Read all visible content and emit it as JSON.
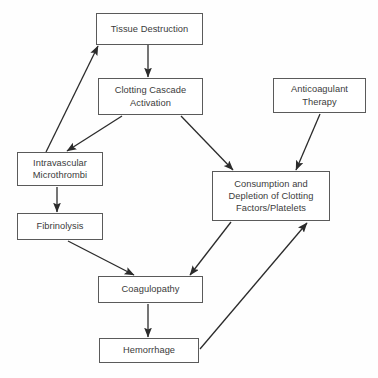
{
  "diagram": {
    "type": "flowchart",
    "canvas": {
      "width": 378,
      "height": 378,
      "background": "#fefefe"
    },
    "style": {
      "box_border": "#5a5a5a",
      "box_fill": "#ffffff",
      "text_color": "#3b3b3b",
      "edge_color": "#2b2b2b"
    },
    "nodes": [
      {
        "id": "tissue-destruction",
        "label": "Tissue Destruction",
        "x": 96,
        "y": 13,
        "w": 107,
        "h": 32
      },
      {
        "id": "clotting-cascade-activation",
        "label": "Clotting Cascade\nActivation",
        "x": 98,
        "y": 78,
        "w": 105,
        "h": 37
      },
      {
        "id": "anticoagulant-therapy",
        "label": "Anticoagulant\nTherapy",
        "x": 273,
        "y": 78,
        "w": 93,
        "h": 35
      },
      {
        "id": "intravascular-microthrombi",
        "label": "Intravascular\nMicrothrombi",
        "x": 17,
        "y": 152,
        "w": 86,
        "h": 34
      },
      {
        "id": "consumption-depletion",
        "label": "Consumption and\nDepletion of Clotting\nFactors/Platelets",
        "x": 212,
        "y": 171,
        "w": 118,
        "h": 50
      },
      {
        "id": "fibrinolysis",
        "label": "Fibrinolysis",
        "x": 17,
        "y": 213,
        "w": 86,
        "h": 27
      },
      {
        "id": "coagulopathy",
        "label": "Coagulopathy",
        "x": 98,
        "y": 276,
        "w": 105,
        "h": 27
      },
      {
        "id": "hemorrhage",
        "label": "Hemorrhage",
        "x": 99,
        "y": 338,
        "w": 100,
        "h": 25
      }
    ],
    "edges": [
      {
        "id": "edge-tissue-to-clotting",
        "from": "tissue-destruction",
        "to": "clotting-cascade-activation",
        "x1": 148,
        "y1": 45,
        "x2": 148,
        "y2": 77
      },
      {
        "id": "edge-clotting-to-microthrombi",
        "from": "clotting-cascade-activation",
        "to": "intravascular-microthrombi",
        "x1": 122,
        "y1": 116,
        "x2": 67,
        "y2": 151
      },
      {
        "id": "edge-clotting-to-consumption",
        "from": "clotting-cascade-activation",
        "to": "consumption-depletion",
        "x1": 181,
        "y1": 116,
        "x2": 233,
        "y2": 170
      },
      {
        "id": "edge-microthrombi-to-tissue",
        "from": "intravascular-microthrombi",
        "to": "tissue-destruction",
        "x1": 46,
        "y1": 152,
        "x2": 98,
        "y2": 46
      },
      {
        "id": "edge-anticoagulant-to-consumption",
        "from": "anticoagulant-therapy",
        "to": "consumption-depletion",
        "x1": 320,
        "y1": 114,
        "x2": 296,
        "y2": 170
      },
      {
        "id": "edge-microthrombi-to-fibrinolysis",
        "from": "intravascular-microthrombi",
        "to": "fibrinolysis",
        "x1": 57,
        "y1": 187,
        "x2": 57,
        "y2": 212
      },
      {
        "id": "edge-fibrinolysis-to-coagulopathy",
        "from": "fibrinolysis",
        "to": "coagulopathy",
        "x1": 68,
        "y1": 241,
        "x2": 134,
        "y2": 275
      },
      {
        "id": "edge-consumption-to-coagulopathy",
        "from": "consumption-depletion",
        "to": "coagulopathy",
        "x1": 231,
        "y1": 222,
        "x2": 190,
        "y2": 275
      },
      {
        "id": "edge-coagulopathy-to-hemorrhage",
        "from": "coagulopathy",
        "to": "hemorrhage",
        "x1": 148,
        "y1": 304,
        "x2": 148,
        "y2": 337
      },
      {
        "id": "edge-hemorrhage-to-consumption",
        "from": "hemorrhage",
        "to": "consumption-depletion",
        "x1": 200,
        "y1": 349,
        "x2": 307,
        "y2": 223
      }
    ]
  }
}
